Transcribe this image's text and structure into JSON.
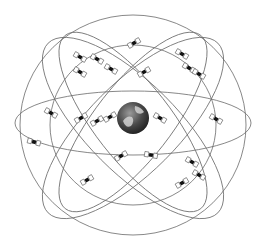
{
  "diagram": {
    "title": "GPS satellite constellation",
    "colors": {
      "background": "#ffffff",
      "orbit": "#6a6a6a",
      "satellite_body": "#111111",
      "earth_dark": "#3a3a3a",
      "earth_light": "#d8d8d8"
    },
    "earth": {
      "cx": 133,
      "cy": 118,
      "r": 16
    },
    "orbits": [
      {
        "name": "outer-sphere",
        "cx": 133,
        "cy": 125,
        "rx": 113,
        "ry": 110,
        "rotate": 0
      },
      {
        "name": "equatorial",
        "cx": 133,
        "cy": 123,
        "rx": 118,
        "ry": 32,
        "rotate": 0
      },
      {
        "name": "inner-ring",
        "cx": 133,
        "cy": 125,
        "rx": 83,
        "ry": 80,
        "rotate": 0
      },
      {
        "name": "diagonal-a",
        "cx": 133,
        "cy": 128,
        "rx": 120,
        "ry": 45,
        "rotate": 45
      },
      {
        "name": "diagonal-b",
        "cx": 133,
        "cy": 128,
        "rx": 120,
        "ry": 45,
        "rotate": -45
      },
      {
        "name": "diagonal-c",
        "cx": 133,
        "cy": 122,
        "rx": 110,
        "ry": 38,
        "rotate": 52
      },
      {
        "name": "diagonal-d",
        "cx": 133,
        "cy": 122,
        "rx": 110,
        "ry": 38,
        "rotate": -52
      }
    ],
    "satellites": [
      {
        "x": 134,
        "y": 43,
        "angle": -30
      },
      {
        "x": 80,
        "y": 57,
        "angle": 30
      },
      {
        "x": 97,
        "y": 59,
        "angle": 30
      },
      {
        "x": 182,
        "y": 54,
        "angle": 30
      },
      {
        "x": 80,
        "y": 72,
        "angle": 30
      },
      {
        "x": 111,
        "y": 69,
        "angle": 30
      },
      {
        "x": 144,
        "y": 72,
        "angle": -30
      },
      {
        "x": 189,
        "y": 68,
        "angle": 30
      },
      {
        "x": 199,
        "y": 74,
        "angle": 30
      },
      {
        "x": 51,
        "y": 113,
        "angle": 30
      },
      {
        "x": 81,
        "y": 118,
        "angle": -30
      },
      {
        "x": 97,
        "y": 121,
        "angle": -30
      },
      {
        "x": 110,
        "y": 117,
        "angle": -30
      },
      {
        "x": 160,
        "y": 118,
        "angle": 30
      },
      {
        "x": 216,
        "y": 119,
        "angle": 30
      },
      {
        "x": 34,
        "y": 142,
        "angle": 15
      },
      {
        "x": 121,
        "y": 156,
        "angle": -30
      },
      {
        "x": 151,
        "y": 155,
        "angle": 10
      },
      {
        "x": 192,
        "y": 162,
        "angle": 30
      },
      {
        "x": 199,
        "y": 175,
        "angle": 30
      },
      {
        "x": 182,
        "y": 183,
        "angle": -30
      },
      {
        "x": 87,
        "y": 180,
        "angle": -30
      }
    ]
  }
}
